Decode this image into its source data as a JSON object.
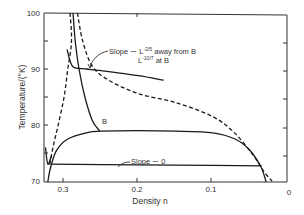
{
  "chart_data": {
    "type": "line",
    "title": "",
    "xlabel": "Density n",
    "ylabel": "Temperature/(°K)",
    "xlim": [
      0.326,
      0.0
    ],
    "ylim": [
      70,
      100
    ],
    "x_inverted": true,
    "grid": false,
    "x_ticks": [
      {
        "value": 0.3,
        "label": "0.3"
      },
      {
        "value": 0.2,
        "label": "0.2"
      },
      {
        "value": 0.1,
        "label": "0.1"
      },
      {
        "value": 0.0,
        "label": "0"
      }
    ],
    "y_ticks": [
      {
        "value": 100,
        "label": "100"
      },
      {
        "value": 90,
        "label": "90"
      },
      {
        "value": 80,
        "label": "80"
      },
      {
        "value": 70,
        "label": "70"
      }
    ],
    "y_minor_ticks": [
      95,
      85,
      75
    ],
    "series": [
      {
        "name": "coexistence-curve",
        "style": "solid",
        "points": [
          [
            0.322,
            69.8
          ],
          [
            0.318,
            72.5
          ],
          [
            0.31,
            75.5
          ],
          [
            0.295,
            77.5
          ],
          [
            0.27,
            78.6
          ],
          [
            0.25,
            78.9
          ],
          [
            0.2,
            79.0
          ],
          [
            0.15,
            78.9
          ],
          [
            0.1,
            78.6
          ],
          [
            0.07,
            77.5
          ],
          [
            0.05,
            75.5
          ],
          [
            0.035,
            72.5
          ],
          [
            0.028,
            69.8
          ]
        ]
      },
      {
        "name": "slope-zero-line",
        "style": "solid",
        "points": [
          [
            0.318,
            73.0
          ],
          [
            0.2,
            72.9
          ],
          [
            0.1,
            72.8
          ],
          [
            0.034,
            72.7
          ]
        ]
      },
      {
        "name": "steep-branch-to-B",
        "style": "solid",
        "points": [
          [
            0.288,
            100.0
          ],
          [
            0.285,
            95.0
          ],
          [
            0.28,
            90.0
          ],
          [
            0.272,
            85.0
          ],
          [
            0.262,
            80.8
          ],
          [
            0.252,
            78.9
          ]
        ]
      },
      {
        "name": "slope-L-2/5-branch",
        "style": "solid",
        "points": [
          [
            0.296,
            93.5
          ],
          [
            0.292,
            91.5
          ],
          [
            0.287,
            90.3
          ],
          [
            0.27,
            90.0
          ],
          [
            0.25,
            89.7
          ],
          [
            0.2,
            88.8
          ],
          [
            0.166,
            88.0
          ]
        ]
      },
      {
        "name": "left-dashed",
        "style": "dashed",
        "points": [
          [
            0.292,
            100.0
          ],
          [
            0.29,
            95.0
          ],
          [
            0.295,
            90.0
          ],
          [
            0.3,
            85.0
          ],
          [
            0.308,
            80.0
          ],
          [
            0.315,
            76.0
          ],
          [
            0.32,
            72.5
          ]
        ]
      },
      {
        "name": "right-dashed",
        "style": "dashed",
        "points": [
          [
            0.282,
            100.0
          ],
          [
            0.275,
            95.0
          ],
          [
            0.262,
            90.5
          ],
          [
            0.24,
            88.0
          ],
          [
            0.2,
            85.6
          ],
          [
            0.15,
            84.0
          ],
          [
            0.1,
            81.5
          ],
          [
            0.07,
            78.5
          ],
          [
            0.045,
            74.5
          ],
          [
            0.03,
            71.5
          ],
          [
            0.02,
            70.0
          ]
        ]
      },
      {
        "name": "left-tick-segment",
        "style": "solid",
        "points": [
          [
            0.325,
            76.0
          ],
          [
            0.322,
            73.0
          ],
          [
            0.317,
            74.5
          ]
        ]
      }
    ],
    "annotations": [
      {
        "text": "B",
        "x": 0.245,
        "y": 79.6
      },
      {
        "text": "Slope ~ L^-2/5 away from B",
        "x": 0.215,
        "y": 93.5
      },
      {
        "text": "L^-10/7 at B",
        "x": 0.18,
        "y": 91.5
      },
      {
        "text": "Slope ~ 0",
        "x": 0.23,
        "y": 74.2
      }
    ]
  },
  "labels": {
    "xlabel": "Density n",
    "ylabel": "Temperature/(°K)",
    "x_ticks": [
      "0.3",
      "0.2",
      "0.1",
      "0"
    ],
    "y_ticks": [
      "100",
      "90",
      "80",
      "70"
    ],
    "annot_B": "B",
    "annot_slope_main": "Slope ∼ L",
    "annot_slope_exp1": "-2/5",
    "annot_slope_tail": " away from B",
    "annot_L": "L",
    "annot_exp2": "-10/7",
    "annot_at_B": " at B",
    "annot_slope0": "Slope ∼ 0"
  },
  "colors": {
    "line": "#1a1a1a",
    "axis": "#333333",
    "background": "#ffffff"
  }
}
